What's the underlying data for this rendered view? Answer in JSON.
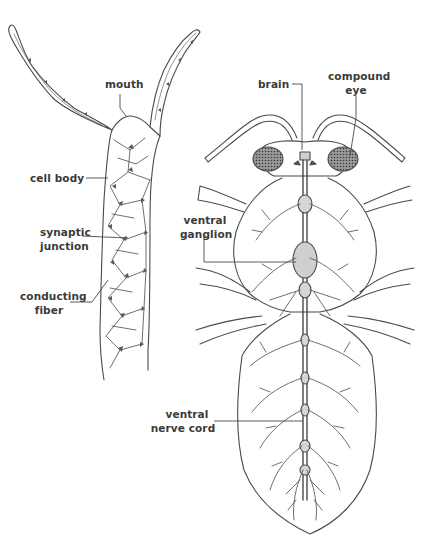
{
  "diagram": {
    "colors": {
      "line": "#4a4a4a",
      "label": "#3a3a3a",
      "background": "#ffffff",
      "eye_fill": "#6b6b6b"
    },
    "hydra": {
      "name": "hydra nerve net",
      "labels": {
        "mouth": "mouth",
        "cell_body": "cell body",
        "synaptic_junction_1": "synaptic",
        "synaptic_junction_2": "junction",
        "conducting_fiber_1": "conducting",
        "conducting_fiber_2": "fiber"
      }
    },
    "insect": {
      "name": "insect nervous system",
      "labels": {
        "brain": "brain",
        "compound_eye_1": "compound",
        "compound_eye_2": "eye",
        "ventral_ganglion_1": "ventral",
        "ventral_ganglion_2": "ganglion",
        "ventral_nerve_cord_1": "ventral",
        "ventral_nerve_cord_2": "nerve cord"
      }
    }
  }
}
